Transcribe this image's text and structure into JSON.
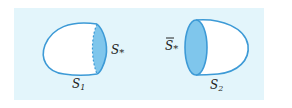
{
  "figure": {
    "left_surface": {
      "label": "S",
      "label_sub": "1",
      "cap_label": "S",
      "cap_sub": "*"
    },
    "right_surface": {
      "label": "S",
      "label_sub": "2",
      "cap_label": "S",
      "cap_sub": "*",
      "cap_overline": true
    },
    "colors": {
      "background": "#e3f5fb",
      "outline": "#3d9ad6",
      "cap_fill": "#7fc6ec"
    }
  }
}
